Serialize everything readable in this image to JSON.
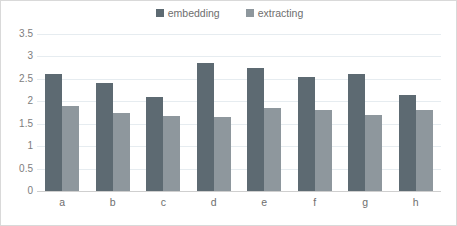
{
  "chart_data": {
    "type": "bar",
    "title": "",
    "subtitle": "",
    "xlabel": "",
    "ylabel": "",
    "categories": [
      "a",
      "b",
      "c",
      "d",
      "e",
      "f",
      "g",
      "h"
    ],
    "series": [
      {
        "name": "embedding",
        "color": "#5d6a72",
        "values": [
          2.6,
          2.4,
          2.1,
          2.85,
          2.75,
          2.55,
          2.6,
          2.15
        ]
      },
      {
        "name": "extracting",
        "color": "#8e979d",
        "values": [
          1.9,
          1.75,
          1.68,
          1.65,
          1.85,
          1.8,
          1.7,
          1.8
        ]
      }
    ],
    "ylim": [
      0,
      3.5
    ],
    "yticks": [
      0,
      0.5,
      1,
      1.5,
      2,
      2.5,
      3,
      3.5
    ],
    "ytick_labels": [
      "0",
      "0.5",
      "1",
      "1.5",
      "2",
      "2.5",
      "3",
      "3.5"
    ],
    "grid": true,
    "legend_position": "top-center",
    "background_color": "#ffffff",
    "gridline_color": "#e6ecf0",
    "axis_line_color": "#cfcfcf",
    "tick_label_color": "#6e6e6e"
  }
}
